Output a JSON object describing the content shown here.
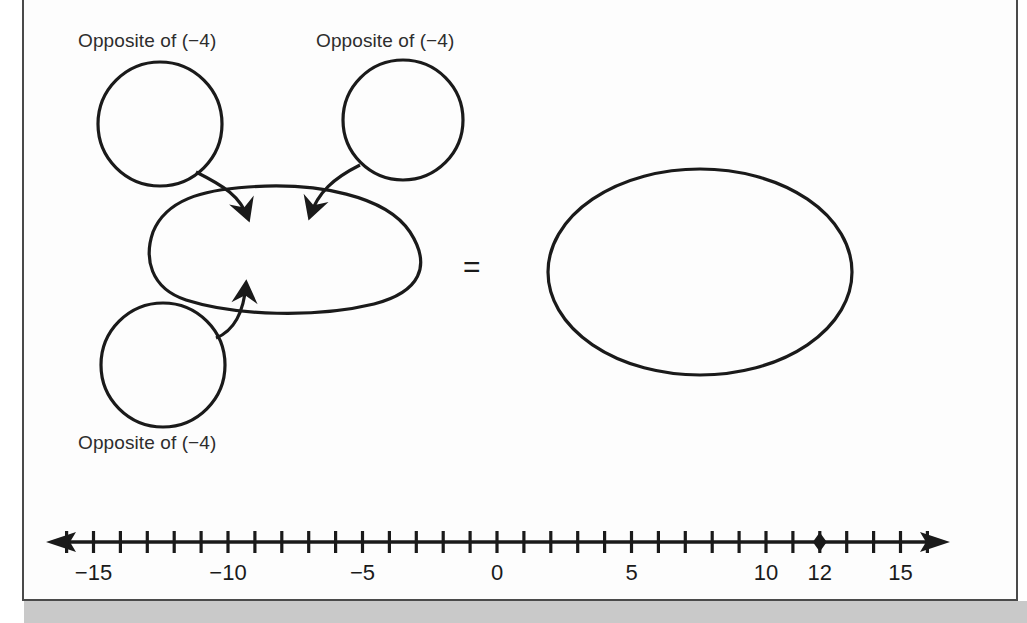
{
  "page": {
    "background_color": "#fdfdfd",
    "border_color": "#4a4a4a",
    "ink_color": "#1a1a1a",
    "text_color": "#2d2d2d"
  },
  "diagram": {
    "type": "arrow-into-blob",
    "equals_symbol": "=",
    "input_bubbles": [
      {
        "id": "top-left",
        "label": "Opposite of (−4)",
        "content": "",
        "shape": "circle"
      },
      {
        "id": "top-right",
        "label": "Opposite of (−4)",
        "content": "",
        "shape": "circle"
      },
      {
        "id": "bottom-left",
        "label": "Opposite of (−4)",
        "content": "",
        "shape": "circle"
      }
    ],
    "blob": {
      "id": "center-blob",
      "content": "",
      "shape": "irregular-blob"
    },
    "result": {
      "id": "result-ellipse",
      "content": "",
      "shape": "ellipse"
    },
    "arrows": [
      {
        "from": "top-left",
        "to": "center-blob",
        "direction": "down"
      },
      {
        "from": "top-right",
        "to": "center-blob",
        "direction": "down"
      },
      {
        "from": "bottom-left",
        "to": "center-blob",
        "direction": "up"
      }
    ]
  },
  "chart_data": {
    "type": "number-line",
    "title": "",
    "xlabel": "",
    "ylabel": "",
    "axis_min": -16,
    "axis_max": 16,
    "tick_step": 1,
    "labeled_ticks": [
      -15,
      -10,
      -5,
      0,
      5,
      10,
      12,
      15
    ],
    "tick_labels": [
      "−15",
      "−10",
      "−5",
      "0",
      "5",
      "10",
      "12",
      "15"
    ],
    "arrowheads": [
      "left",
      "right"
    ],
    "points": [
      {
        "value": 12,
        "label": "12",
        "marker": "diamond",
        "filled": true
      }
    ]
  }
}
